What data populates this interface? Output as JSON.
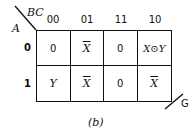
{
  "diagram": {
    "type": "karnaugh-map",
    "row_variable": "A",
    "column_variables": "BC",
    "output_label": "G",
    "caption": "(b)",
    "column_headers": [
      "00",
      "01",
      "11",
      "10"
    ],
    "row_headers": [
      "0",
      "1"
    ],
    "cells": [
      [
        "0",
        "X",
        "0",
        "X⊙Y"
      ],
      [
        "Y",
        "X",
        "0",
        "X"
      ]
    ],
    "cell_complemented": [
      [
        false,
        true,
        false,
        false
      ],
      [
        false,
        true,
        false,
        true
      ]
    ]
  }
}
